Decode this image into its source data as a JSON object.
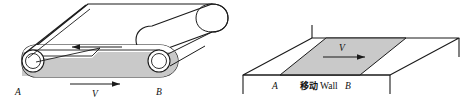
{
  "figure": {
    "background_color": "#ffffff",
    "stroke_color": "#1a1a1a",
    "shade_color": "#c9c9c9",
    "shade_color_dark": "#b4b4b4",
    "panels": [
      {
        "id": "conveyor-belt",
        "name": "conveyor-belt-diagram",
        "labels": {
          "left_roller": "A",
          "right_roller": "B",
          "velocity_bottom": "V"
        },
        "arrows": [
          {
            "name": "top-belt-arrow",
            "direction": "left",
            "label": ""
          },
          {
            "name": "bottom-belt-arrow",
            "direction": "right",
            "label": "V"
          }
        ]
      },
      {
        "id": "moving-wall",
        "name": "moving-wall-diagram",
        "labels": {
          "left_edge": "A",
          "wall_cjk": "移动",
          "wall_roman": "Wall",
          "right_edge": "B",
          "velocity": "V"
        },
        "arrows": [
          {
            "name": "wall-velocity-arrow",
            "direction": "right",
            "label": "V"
          }
        ]
      }
    ]
  }
}
